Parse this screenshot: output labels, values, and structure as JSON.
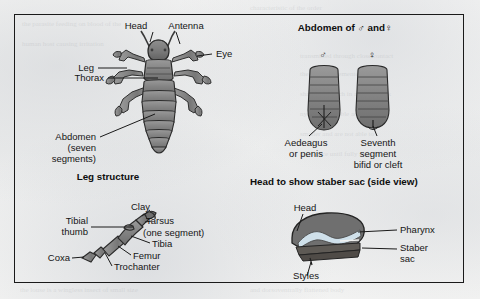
{
  "figure": {
    "frame": {
      "border_color": "#1a1a1a"
    },
    "background_color": "#f2f2f0"
  },
  "panels": {
    "whole_body": {
      "labels": {
        "head": "Head",
        "antenna": "Antenna",
        "eye": "Eye",
        "leg": "Leg",
        "thorax": "Thorax",
        "abdomen_line1": "Abdomen",
        "abdomen_line2": "(seven",
        "abdomen_line3": "segments)"
      }
    },
    "leg_structure": {
      "heading": "Leg structure",
      "labels": {
        "tibial_line1": "Tibial",
        "tibial_line2": "thumb",
        "clay": "Clay",
        "tarsus": "Tarsus",
        "tarsus_note": "(one segment)",
        "tibia": "Tibia",
        "femur": "Femur",
        "trochanter": "Trochanter",
        "coxa": "Coxa"
      }
    },
    "abdomen_sexes": {
      "heading": "Abdomen of ♂ and♀",
      "male_symbol": "♂",
      "female_symbol": "♀",
      "labels": {
        "male_line1": "Aedeagus",
        "male_line2": "or penis",
        "female_line1": "Seventh",
        "female_line2": "segment",
        "female_line3": "bifid or cleft"
      }
    },
    "head_side_view": {
      "heading": "Head to show staber sac (side view)",
      "labels": {
        "head": "Head",
        "pharynx": "Pharynx",
        "staber_line1": "Staber",
        "staber_line2": "sac",
        "styles": "Styles"
      }
    }
  },
  "colors": {
    "body_gray": "#8b8b8b",
    "body_gray_dark": "#6e6e6e",
    "body_gray_light": "#a5a5a5",
    "outline": "#2a2a2a",
    "pharynx_blue": "#cfe0ea"
  }
}
